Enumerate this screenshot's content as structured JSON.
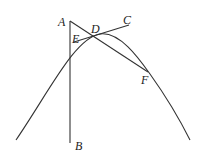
{
  "diagram": {
    "type": "geometry",
    "points": {
      "A": {
        "label": "A",
        "x": 70,
        "y": 21,
        "lx": 58,
        "ly": 26
      },
      "B": {
        "label": "B",
        "x": 70,
        "y": 143,
        "lx": 75,
        "ly": 150
      },
      "C": {
        "label": "C",
        "x": 130,
        "y": 25,
        "lx": 123,
        "ly": 24
      },
      "D": {
        "label": "D",
        "x": 95,
        "y": 35,
        "lx": 92,
        "ly": 33
      },
      "E": {
        "label": "E",
        "x": 72,
        "y": 42,
        "lx": 72,
        "ly": 42
      },
      "F": {
        "label": "F",
        "x": 148,
        "y": 72,
        "lx": 142,
        "ly": 84
      }
    },
    "colors": {
      "stroke": "#333333",
      "background": "#ffffff"
    }
  }
}
